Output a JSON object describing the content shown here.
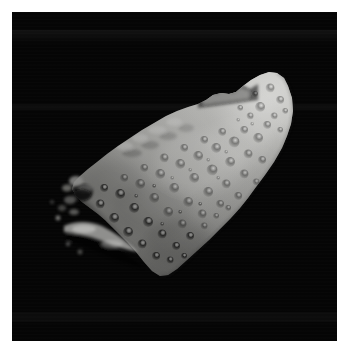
{
  "image": {
    "domain": "natural-image",
    "subject": "asteroid",
    "subject_name": "951 Gaspra",
    "description": "Grayscale spacecraft photograph of an irregular, heavily cratered asteroid set against black space, printed with a white photographic border.",
    "orientation": "elongated wedge running from lower-left to upper-right",
    "width_px": 345,
    "height_px": 350
  },
  "frame": {
    "border_label": "white photo border",
    "border_color": "#ffffff",
    "border_width_px": 12,
    "plate": {
      "label": "image plate",
      "left_px": 12,
      "top_px": 12,
      "width_px": 325,
      "height_px": 329,
      "background_color": "#050505"
    }
  },
  "background": {
    "label": "black space background",
    "color": "#050505",
    "artifact_label": "horizontal scanline noise"
  },
  "asteroid": {
    "label": "asteroid body",
    "silhouette_label": "irregular wedge silhouette",
    "apex_label": "sunlit upper-right tip",
    "apex_point_px": [
      277,
      73
    ],
    "bottom_tip_px": [
      165,
      275
    ],
    "left_edge_px": [
      72,
      212
    ],
    "right_limb_px": [
      290,
      150
    ],
    "colors": {
      "highlight": "#c6c6c4",
      "bright": "#b4b4b1",
      "midtone": "#949491",
      "shadow_tone": "#6a6a68",
      "deep_shadow": "#3a3a39",
      "limb_dark": "#1a1a1a",
      "space": "#050505"
    },
    "features": [
      {
        "name": "sunlit-limb",
        "label": "sunlit limb along upper-right edge"
      },
      {
        "name": "terminator",
        "label": "terminator shading toward lower-left"
      },
      {
        "name": "saddle-notch",
        "label": "jagged saddle notch near top ridge",
        "position_px": [
          220,
          94
        ]
      },
      {
        "name": "dark-crater",
        "label": "large dark crater on western flank",
        "position_px": [
          82,
          210
        ]
      },
      {
        "name": "bright-ridge",
        "label": "bright illuminated ridge below western flank",
        "position_px": [
          100,
          243
        ]
      },
      {
        "name": "detached-fragments",
        "label": "detached sunlit fragments off the left limb",
        "position_px": [
          78,
          236
        ]
      },
      {
        "name": "crater-field",
        "label": "dense small-crater field across main face",
        "position_px": [
          190,
          170
        ]
      }
    ],
    "crater_count_visible": 60
  }
}
